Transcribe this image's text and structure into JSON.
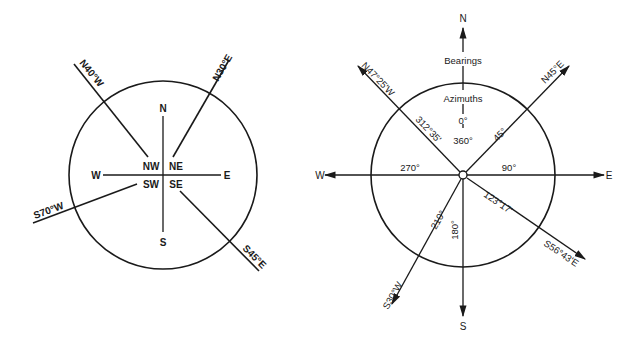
{
  "left_diagram": {
    "title": "Quadrant bearings",
    "cardinals": {
      "n": "N",
      "s": "S",
      "e": "E",
      "w": "W"
    },
    "quadrants": {
      "nw": "NW",
      "ne": "NE",
      "sw": "SW",
      "se": "SE"
    },
    "bearings": [
      {
        "label": "N40°W",
        "angle_deg": 320
      },
      {
        "label": "N30°E",
        "angle_deg": 30
      },
      {
        "label": "S70°W",
        "angle_deg": 250
      },
      {
        "label": "S45°E",
        "angle_deg": 135
      }
    ]
  },
  "right_diagram": {
    "title": "Bearings and azimuths",
    "cardinals": {
      "n": "N",
      "s": "S",
      "e": "E",
      "w": "W"
    },
    "legend": {
      "bearings": "Bearings",
      "azimuths": "Azimuths"
    },
    "north_azimuth": {
      "zero": "0°",
      "full": "360°"
    },
    "axis_azimuths": {
      "east": "90°",
      "south": "180°",
      "west": "270°"
    },
    "lines": [
      {
        "bearing": "N47°25'W",
        "azimuth": "312°35'",
        "angle_deg": 312.58
      },
      {
        "bearing": "N45°E",
        "azimuth": "45°",
        "angle_deg": 45
      },
      {
        "bearing": "S56°43'E",
        "azimuth": "123°17'",
        "angle_deg": 123.28
      },
      {
        "bearing": "S30°W",
        "azimuth": "210°",
        "angle_deg": 210
      }
    ]
  }
}
